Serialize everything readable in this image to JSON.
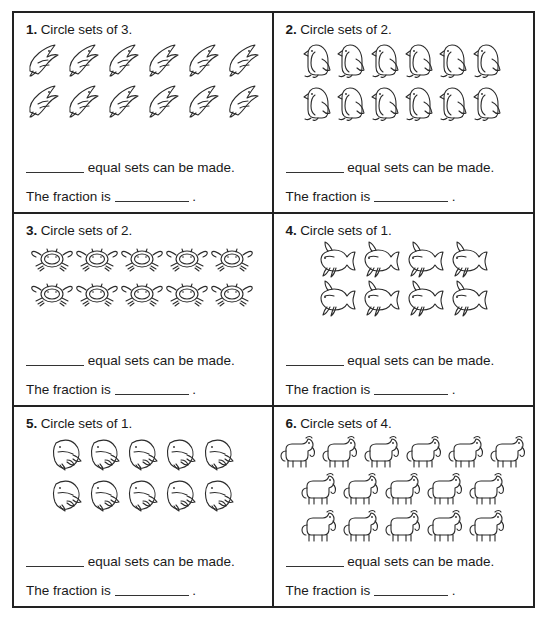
{
  "worksheet": {
    "title": "Circle sets worksheet",
    "sets_sentence_suffix": "equal sets can be made.",
    "fraction_sentence_prefix": "The fraction is",
    "fraction_sentence_suffix": ".",
    "border_color": "#222222",
    "ink_color": "#1a1a1a",
    "background_color": "#ffffff"
  },
  "problems": [
    {
      "number": "1.",
      "prompt": "Circle sets of 3.",
      "set_size": 3,
      "icon": "dolphin-icon",
      "icon_label": "dolphin",
      "total_count": 12,
      "rows": [
        6,
        6
      ],
      "answer_sets_blank": "",
      "answer_fraction_blank": ""
    },
    {
      "number": "2.",
      "prompt": "Circle sets of 2.",
      "set_size": 2,
      "icon": "penguin-icon",
      "icon_label": "penguin",
      "total_count": 12,
      "rows": [
        6,
        6
      ],
      "answer_sets_blank": "",
      "answer_fraction_blank": ""
    },
    {
      "number": "3.",
      "prompt": "Circle sets of 2.",
      "set_size": 2,
      "icon": "crab-icon",
      "icon_label": "crab",
      "total_count": 10,
      "rows": [
        5,
        5
      ],
      "answer_sets_blank": "",
      "answer_fraction_blank": ""
    },
    {
      "number": "4.",
      "prompt": "Circle sets of 1.",
      "set_size": 1,
      "icon": "goldfish-icon",
      "icon_label": "goldfish",
      "total_count": 8,
      "rows": [
        4,
        4
      ],
      "answer_sets_blank": "",
      "answer_fraction_blank": ""
    },
    {
      "number": "5.",
      "prompt": "Circle sets of 1.",
      "set_size": 1,
      "icon": "whale-icon",
      "icon_label": "whale",
      "total_count": 10,
      "rows": [
        5,
        5
      ],
      "answer_sets_blank": "",
      "answer_fraction_blank": ""
    },
    {
      "number": "6.",
      "prompt": "Circle sets of 4.",
      "set_size": 4,
      "icon": "dog-icon",
      "icon_label": "dog",
      "total_count": 16,
      "rows": [
        6,
        5,
        5
      ],
      "answer_sets_blank": "",
      "answer_fraction_blank": ""
    }
  ]
}
